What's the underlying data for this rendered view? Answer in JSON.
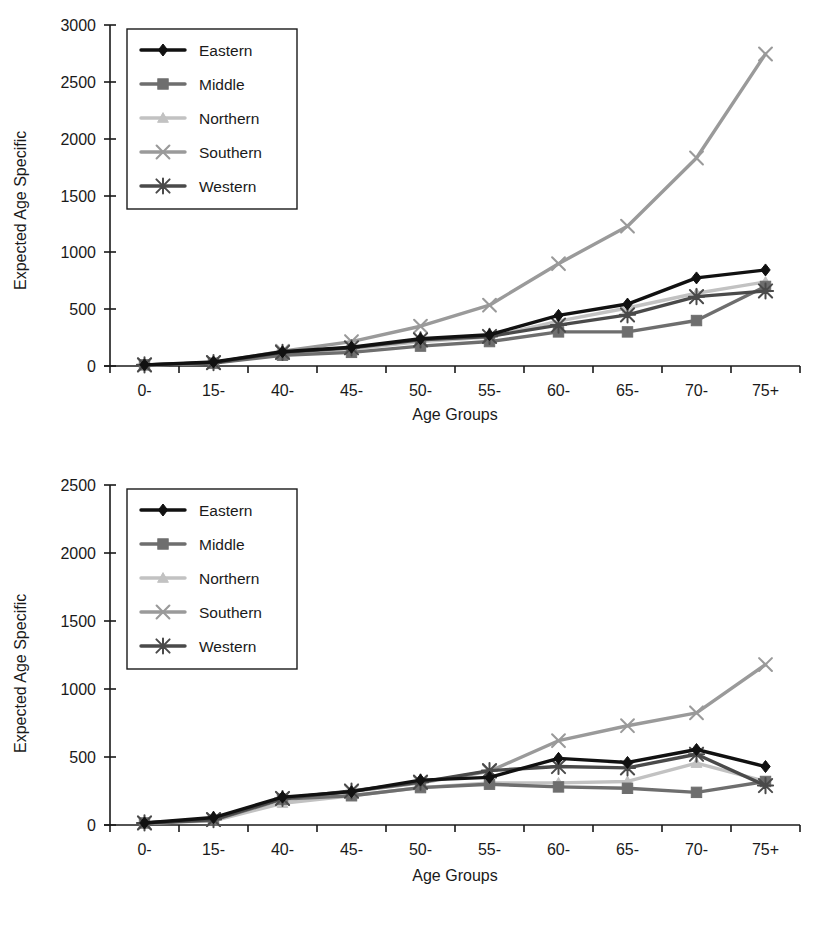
{
  "figure": {
    "background": "#ffffff"
  },
  "colors": {
    "eastern": "#111111",
    "middle": "#6e6e6e",
    "northern": "#c2c2c2",
    "southern": "#9a9a9a",
    "western": "#4a4a4a",
    "axis": "#1a1a1a"
  },
  "legend": {
    "items": [
      {
        "label": "Eastern",
        "color": "#111111",
        "marker": "diamond"
      },
      {
        "label": "Middle",
        "color": "#6e6e6e",
        "marker": "square"
      },
      {
        "label": "Northern",
        "color": "#c2c2c2",
        "marker": "triangle"
      },
      {
        "label": "Southern",
        "color": "#9a9a9a",
        "marker": "cross"
      },
      {
        "label": "Western",
        "color": "#4a4a4a",
        "marker": "asterisk"
      }
    ]
  },
  "chart_data": [
    {
      "type": "line",
      "id": "top-chart",
      "title": "",
      "xlabel": "Age Groups",
      "ylabel": "Expected Age Specific",
      "categories": [
        "0-",
        "15-",
        "40-",
        "45-",
        "50-",
        "55-",
        "60-",
        "65-",
        "70-",
        "75+"
      ],
      "ylim": [
        0,
        3000
      ],
      "yticks": [
        0,
        500,
        1000,
        1500,
        2000,
        2500,
        3000
      ],
      "grid": false,
      "legend_position": "upper-left",
      "series": [
        {
          "name": "Eastern",
          "color": "#111111",
          "marker": "diamond",
          "values": [
            10,
            35,
            125,
            165,
            240,
            275,
            445,
            545,
            775,
            845
          ]
        },
        {
          "name": "Middle",
          "color": "#6e6e6e",
          "marker": "square",
          "values": [
            10,
            25,
            95,
            120,
            175,
            215,
            300,
            300,
            400,
            700
          ]
        },
        {
          "name": "Northern",
          "color": "#c2c2c2",
          "marker": "triangle",
          "values": [
            8,
            25,
            110,
            150,
            215,
            255,
            395,
            510,
            640,
            740
          ]
        },
        {
          "name": "Southern",
          "color": "#9a9a9a",
          "marker": "cross",
          "values": [
            10,
            30,
            130,
            215,
            350,
            535,
            900,
            1230,
            1830,
            2745
          ]
        },
        {
          "name": "Western",
          "color": "#4a4a4a",
          "marker": "asterisk",
          "values": [
            10,
            30,
            120,
            160,
            230,
            260,
            360,
            450,
            610,
            660
          ]
        }
      ]
    },
    {
      "type": "line",
      "id": "bottom-chart",
      "title": "",
      "xlabel": "Age Groups",
      "ylabel": "Expected Age Specific",
      "categories": [
        "0-",
        "15-",
        "40-",
        "45-",
        "50-",
        "55-",
        "60-",
        "65-",
        "70-",
        "75+"
      ],
      "ylim": [
        0,
        2500
      ],
      "yticks": [
        0,
        500,
        1000,
        1500,
        2000,
        2500
      ],
      "grid": false,
      "legend_position": "upper-left",
      "series": [
        {
          "name": "Eastern",
          "color": "#111111",
          "marker": "diamond",
          "values": [
            15,
            55,
            205,
            245,
            330,
            350,
            490,
            460,
            555,
            430
          ]
        },
        {
          "name": "Middle",
          "color": "#6e6e6e",
          "marker": "square",
          "values": [
            15,
            35,
            190,
            215,
            275,
            300,
            280,
            270,
            240,
            320
          ]
        },
        {
          "name": "Northern",
          "color": "#c2c2c2",
          "marker": "triangle",
          "values": [
            12,
            30,
            160,
            215,
            275,
            310,
            310,
            320,
            455,
            320
          ]
        },
        {
          "name": "Southern",
          "color": "#9a9a9a",
          "marker": "cross",
          "values": [
            15,
            40,
            195,
            245,
            310,
            395,
            620,
            730,
            825,
            1180
          ]
        },
        {
          "name": "Western",
          "color": "#4a4a4a",
          "marker": "asterisk",
          "values": [
            15,
            40,
            195,
            250,
            315,
            400,
            430,
            420,
            520,
            290
          ]
        }
      ]
    }
  ]
}
